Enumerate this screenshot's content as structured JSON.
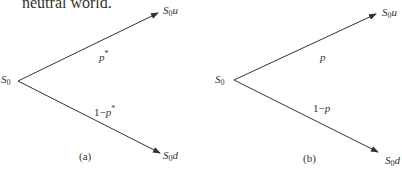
{
  "header": {
    "partial_text": "neutral world."
  },
  "diagram_a": {
    "root": {
      "base": "S",
      "sub": "0"
    },
    "up_node": {
      "base": "S",
      "sub": "0",
      "suffix": "u"
    },
    "down_node": {
      "base": "S",
      "sub": "0",
      "suffix": "d"
    },
    "up_prob": {
      "base": "p",
      "sup": "*"
    },
    "down_prob": {
      "prefix": "1−",
      "base": "p",
      "sup": "*"
    },
    "caption": "(a)"
  },
  "diagram_b": {
    "root": {
      "base": "S",
      "sub": "0"
    },
    "up_node": {
      "base": "S",
      "sub": "0",
      "suffix": "u"
    },
    "down_node": {
      "base": "S",
      "sub": "0",
      "suffix": "d"
    },
    "up_prob": {
      "base": "p"
    },
    "down_prob": {
      "prefix": "1−",
      "base": "p"
    },
    "caption": "(b)"
  },
  "colors": {
    "line": "#333333",
    "text": "#333333",
    "background": "#ffffff"
  }
}
